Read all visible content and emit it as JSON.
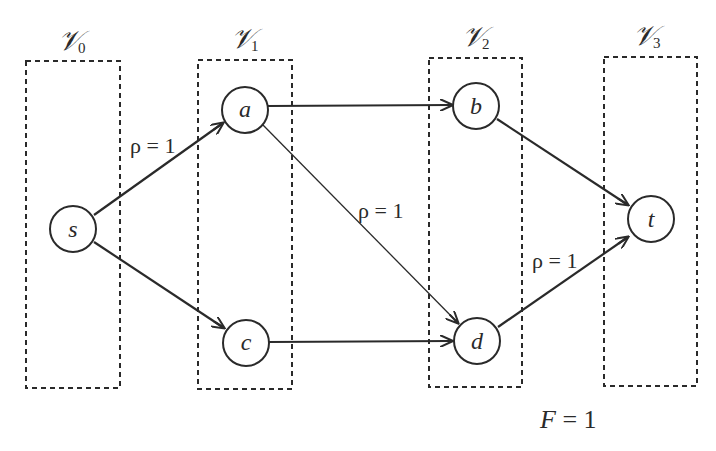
{
  "partitions": [
    {
      "id": "V0",
      "symbol": "𝒱",
      "subscript": "0"
    },
    {
      "id": "V1",
      "symbol": "𝒱",
      "subscript": "1"
    },
    {
      "id": "V2",
      "symbol": "𝒱",
      "subscript": "2"
    },
    {
      "id": "V3",
      "symbol": "𝒱",
      "subscript": "3"
    }
  ],
  "nodes": [
    {
      "id": "s",
      "label": "s",
      "partition": "V0"
    },
    {
      "id": "a",
      "label": "a",
      "partition": "V1"
    },
    {
      "id": "c",
      "label": "c",
      "partition": "V1"
    },
    {
      "id": "b",
      "label": "b",
      "partition": "V2"
    },
    {
      "id": "d",
      "label": "d",
      "partition": "V2"
    },
    {
      "id": "t",
      "label": "t",
      "partition": "V3"
    }
  ],
  "edges": [
    {
      "from": "s",
      "to": "a",
      "label": "ρ = 1"
    },
    {
      "from": "s",
      "to": "c",
      "label": ""
    },
    {
      "from": "a",
      "to": "b",
      "label": ""
    },
    {
      "from": "a",
      "to": "d",
      "label": "ρ = 1"
    },
    {
      "from": "c",
      "to": "d",
      "label": ""
    },
    {
      "from": "b",
      "to": "t",
      "label": ""
    },
    {
      "from": "d",
      "to": "t",
      "label": "ρ = 1"
    }
  ],
  "flow": {
    "variable": "F",
    "equals": " = 1"
  }
}
